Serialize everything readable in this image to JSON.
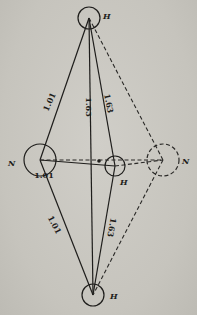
{
  "diagram": {
    "atoms": [
      {
        "id": "H_top",
        "symbol": "H",
        "label": "H",
        "cx": 89,
        "cy": 18,
        "r": 11,
        "style": "solid",
        "label_x": 103,
        "label_y": 19
      },
      {
        "id": "H_bottom",
        "symbol": "H",
        "label": "H",
        "cx": 93,
        "cy": 295,
        "r": 11,
        "style": "solid",
        "label_x": 110,
        "label_y": 299
      },
      {
        "id": "N_left",
        "symbol": "N",
        "label": "N",
        "cx": 40,
        "cy": 160,
        "r": 16,
        "style": "solid",
        "label_x": 8,
        "label_y": 166
      },
      {
        "id": "H_middle",
        "symbol": "H",
        "label": "H",
        "cx": 115,
        "cy": 166,
        "r": 10,
        "style": "solid",
        "label_x": 120,
        "label_y": 185
      },
      {
        "id": "N_right",
        "symbol": "N",
        "label": "N",
        "cx": 163,
        "cy": 160,
        "r": 16,
        "style": "dashed",
        "label_x": 182,
        "label_y": 164
      }
    ],
    "bonds": [
      {
        "from": "H_top",
        "to": "N_left",
        "style": "solid",
        "label": "1.01"
      },
      {
        "from": "N_left",
        "to": "H_bottom",
        "style": "solid",
        "label": "1.01"
      },
      {
        "from": "N_left",
        "to": "H_middle",
        "style": "solid",
        "label": "1.01"
      },
      {
        "from": "H_top",
        "to": "H_bottom",
        "style": "solid",
        "label": "1.63"
      },
      {
        "from": "H_top",
        "to": "H_middle",
        "style": "solid",
        "label": "1.63"
      },
      {
        "from": "H_middle",
        "to": "H_bottom",
        "style": "solid",
        "label": "1.63"
      },
      {
        "from": "H_top",
        "to": "N_right",
        "style": "dashed",
        "label": ""
      },
      {
        "from": "N_right",
        "to": "H_bottom",
        "style": "dashed",
        "label": ""
      },
      {
        "from": "N_left",
        "to": "N_right",
        "style": "dashed",
        "label": ""
      },
      {
        "from": "H_middle",
        "to": "N_right",
        "style": "dashed",
        "label": ""
      }
    ],
    "center_dot": {
      "cx": 99,
      "cy": 161,
      "r": 1.8
    },
    "bond_labels": [
      {
        "text": "1.01",
        "x": 52,
        "y": 103,
        "rotate": -66
      },
      {
        "text": "1.63",
        "x": 86,
        "y": 107,
        "rotate": 90
      },
      {
        "text": "1.63",
        "x": 106,
        "y": 104,
        "rotate": 78
      },
      {
        "text": "1.01",
        "x": 44,
        "y": 178,
        "rotate": 0
      },
      {
        "text": "1.01",
        "x": 52,
        "y": 226,
        "rotate": 62
      },
      {
        "text": "1.63",
        "x": 109,
        "y": 227,
        "rotate": 100
      }
    ]
  }
}
